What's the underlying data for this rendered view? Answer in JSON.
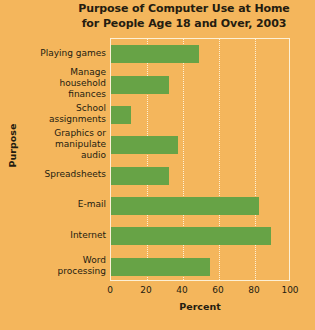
{
  "chart_data": {
    "type": "bar",
    "orientation": "horizontal",
    "title": "Purpose of Computer Use at Home for People Age 18 and Over, 2003",
    "title_lines": [
      "Purpose of Computer Use at Home",
      "for People Age 18 and Over, 2003"
    ],
    "xlabel": "Percent",
    "ylabel": "Purpose",
    "categories": [
      "Playing games",
      "Manage household finances",
      "School assignments",
      "Graphics or manipulate audio",
      "Spreadsheets",
      "E-mail",
      "Internet",
      "Word processing"
    ],
    "category_label_lines": [
      [
        "Playing games"
      ],
      [
        "Manage",
        "household",
        "finances"
      ],
      [
        "School",
        "assignments"
      ],
      [
        "Graphics or",
        "manipulate",
        "audio"
      ],
      [
        "Spreadsheets"
      ],
      [
        "E-mail"
      ],
      [
        "Internet"
      ],
      [
        "Word",
        "processing"
      ]
    ],
    "values": [
      49,
      32,
      11,
      37,
      32,
      82,
      89,
      55
    ],
    "xlim": [
      0,
      100
    ],
    "xticks": [
      0,
      20,
      40,
      60,
      80,
      100
    ],
    "xtick_labels": [
      "0",
      "20",
      "40",
      "60",
      "80",
      "100"
    ],
    "grid": true,
    "grid_axis": "x",
    "grid_style": "dotted",
    "legend": false,
    "colors": {
      "background": "#f4b65c",
      "bar": "#67a346",
      "grid": "#fdf0d5",
      "frame": "#fdf0d5",
      "text": "#241c10"
    }
  }
}
